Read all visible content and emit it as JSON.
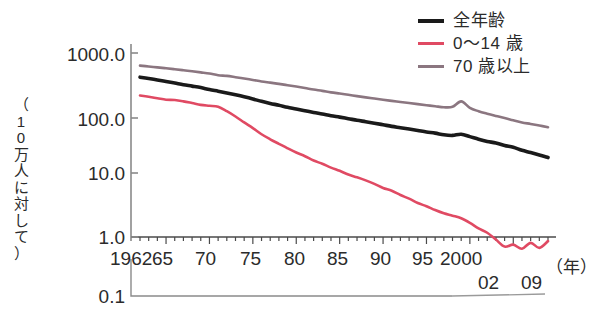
{
  "chart_data": {
    "type": "line",
    "title": "",
    "xlabel": "(年)",
    "ylabel": "（10万人に対して）",
    "yscale": "log",
    "ylim": [
      0.1,
      1000.0
    ],
    "ytick_labels": [
      "1000.0",
      "100.0",
      "10.0",
      "1.0",
      "0.1"
    ],
    "ytick_values": [
      1000.0,
      100.0,
      10.0,
      1.0,
      0.1
    ],
    "xlim": [
      1962,
      2009
    ],
    "xtick_labels": [
      "1962",
      "65",
      "70",
      "75",
      "80",
      "85",
      "90",
      "95",
      "2000",
      "02",
      "09"
    ],
    "xtick_values": [
      1962,
      1965,
      1970,
      1975,
      1980,
      1985,
      1990,
      1995,
      2000,
      2002,
      2009
    ],
    "grid": false,
    "legend_position": "top-right",
    "x": [
      1962,
      1963,
      1964,
      1965,
      1966,
      1967,
      1968,
      1969,
      1970,
      1971,
      1972,
      1973,
      1974,
      1975,
      1976,
      1977,
      1978,
      1979,
      1980,
      1981,
      1982,
      1983,
      1984,
      1985,
      1986,
      1987,
      1988,
      1989,
      1990,
      1991,
      1992,
      1993,
      1994,
      1995,
      1996,
      1997,
      1998,
      1999,
      2000,
      2001,
      2002,
      2003,
      2004,
      2005,
      2006,
      2007,
      2008,
      2009
    ],
    "series": [
      {
        "name": "全年齢",
        "color": "#1a1a1a",
        "width": 3.6,
        "values": [
          400,
          380,
          360,
          340,
          320,
          300,
          285,
          270,
          250,
          235,
          220,
          205,
          190,
          175,
          160,
          148,
          138,
          128,
          120,
          112,
          105,
          99,
          93,
          88,
          83,
          78,
          74,
          70,
          66,
          62,
          59,
          56,
          53,
          50,
          48,
          45,
          44,
          46,
          42,
          38,
          35,
          33,
          30,
          28,
          25,
          23,
          21,
          19
        ]
      },
      {
        "name": "0〜14 歳",
        "color": "#e04a63",
        "width": 2.6,
        "values": [
          200,
          190,
          180,
          170,
          168,
          160,
          150,
          140,
          135,
          130,
          110,
          90,
          72,
          58,
          46,
          38,
          32,
          27,
          23,
          20,
          17,
          15,
          13,
          11.5,
          10,
          9,
          8,
          7,
          6,
          5.4,
          4.6,
          4.0,
          3.4,
          3.0,
          2.6,
          2.3,
          2.1,
          1.9,
          1.6,
          1.3,
          1.1,
          0.85,
          0.65,
          0.7,
          0.6,
          0.75,
          0.62,
          0.8
        ]
      },
      {
        "name": "70 歳以上",
        "color": "#8b7680",
        "width": 2.6,
        "values": [
          620,
          600,
          580,
          560,
          540,
          520,
          500,
          480,
          460,
          430,
          420,
          400,
          380,
          360,
          340,
          325,
          310,
          295,
          280,
          265,
          250,
          238,
          225,
          215,
          205,
          195,
          186,
          178,
          170,
          163,
          156,
          150,
          144,
          138,
          133,
          128,
          130,
          160,
          125,
          110,
          100,
          92,
          85,
          78,
          72,
          68,
          64,
          60
        ]
      }
    ]
  },
  "legend": {
    "items": [
      {
        "label": "全年齢",
        "style": "thick"
      },
      {
        "label": "0〜14 歳",
        "style": "thin"
      },
      {
        "label": "70 歳以上",
        "style": "mauve"
      }
    ]
  },
  "axes": {
    "y_label_chars": [
      "（",
      "1",
      "0",
      "万",
      "人",
      "に",
      "対",
      "し",
      "て",
      "）"
    ],
    "y_ticks": [
      {
        "label": "1000.0",
        "top": 44
      },
      {
        "label": "100.0",
        "top": 109
      },
      {
        "label": "10.0",
        "top": 163
      },
      {
        "label": "1.0",
        "top": 227
      },
      {
        "label": "0.1",
        "top": 286
      }
    ],
    "x_ticks": [
      {
        "label": "1962",
        "left": 110
      },
      {
        "label": "65",
        "left": 152
      },
      {
        "label": "70",
        "left": 195
      },
      {
        "label": "75",
        "left": 240
      },
      {
        "label": "80",
        "left": 284
      },
      {
        "label": "85",
        "left": 327
      },
      {
        "label": "90",
        "left": 370
      },
      {
        "label": "95",
        "left": 412
      },
      {
        "label": "2000",
        "left": 440
      },
      {
        "label": "02",
        "left": 478
      },
      {
        "label": "09",
        "left": 521
      }
    ],
    "x_unit": "（年）"
  }
}
